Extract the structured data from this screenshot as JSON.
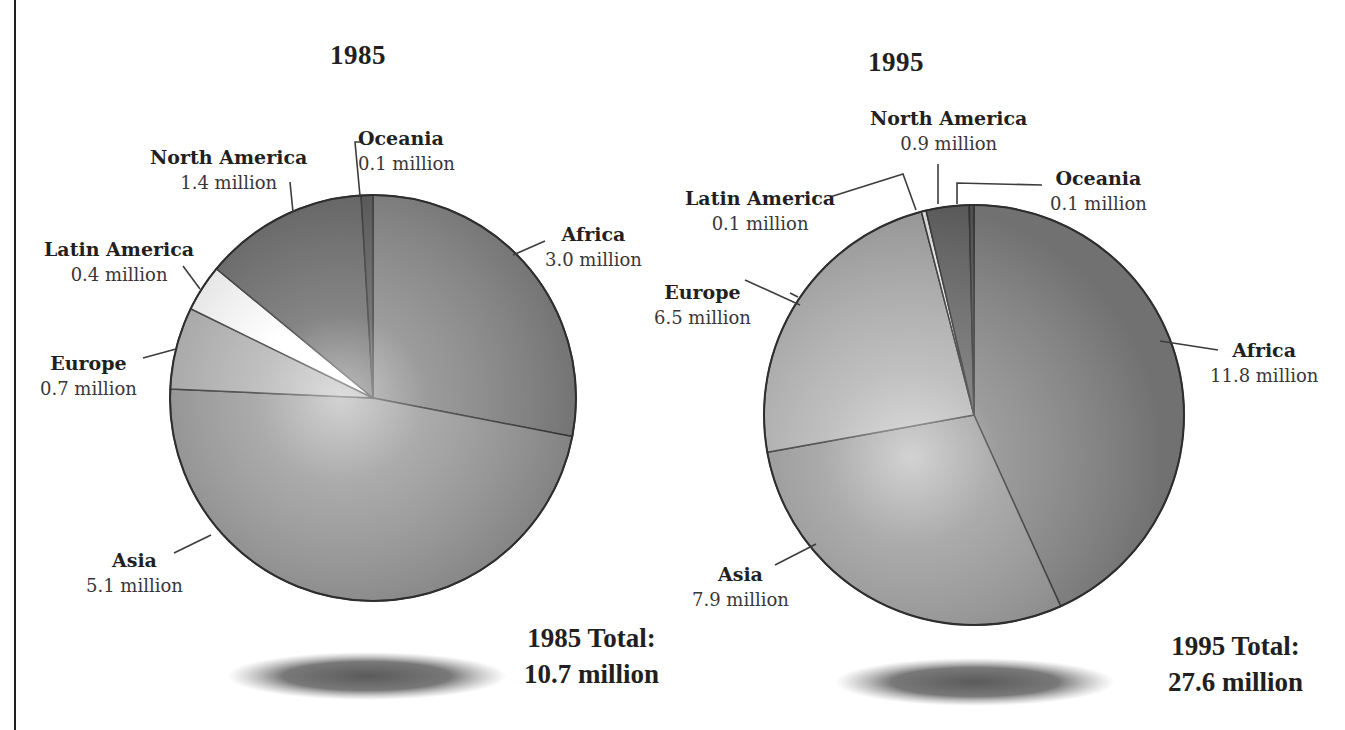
{
  "chart_data": [
    {
      "type": "pie",
      "title": "1985",
      "categories": [
        "Africa",
        "Asia",
        "Europe",
        "Latin America",
        "North America",
        "Oceania"
      ],
      "values": [
        3.0,
        5.1,
        0.7,
        0.4,
        1.4,
        0.1
      ],
      "unit": "million",
      "value_labels": [
        "3.0 million",
        "5.1 million",
        "0.7 million",
        "0.4 million",
        "1.4 million",
        "0.1 million"
      ],
      "total_label": "1985 Total:",
      "total_value": "10.7 million",
      "start_angle": "12 o'clock",
      "direction": "clockwise",
      "legend": "none (direct labels with leader lines)"
    },
    {
      "type": "pie",
      "title": "1995",
      "categories": [
        "Africa",
        "Asia",
        "Europe",
        "Latin America",
        "North America",
        "Oceania"
      ],
      "values": [
        11.8,
        7.9,
        6.5,
        0.1,
        0.9,
        0.1
      ],
      "unit": "million",
      "value_labels": [
        "11.8 million",
        "7.9 million",
        "6.5 million",
        "0.1 million",
        "0.9 million",
        "0.1 million"
      ],
      "total_label": "1995 Total:",
      "total_value": "27.6 million",
      "start_angle": "12 o'clock",
      "direction": "clockwise",
      "legend": "none (direct labels with leader lines)"
    }
  ],
  "colors": {
    "Africa": "#8a8a8a",
    "Asia": "#9c9c9c",
    "Europe": "#b4b4b4",
    "Latin America": "#ffffff",
    "North America": "#6e6e6e",
    "Oceania": "#5f5f5f",
    "outline": "#3c3c3c",
    "land": "#5a5a5a"
  },
  "pies": [
    {
      "year": "1985",
      "total_label": "1985 Total:",
      "total_value": "10.7 million",
      "labels": [
        {
          "name": "Oceania",
          "value": "0.1 million"
        },
        {
          "name": "North America",
          "value": "1.4 million"
        },
        {
          "name": "Africa",
          "value": "3.0 million"
        },
        {
          "name": "Latin America",
          "value": "0.4 million"
        },
        {
          "name": "Europe",
          "value": "0.7 million"
        },
        {
          "name": "Asia",
          "value": "5.1 million"
        }
      ]
    },
    {
      "year": "1995",
      "total_label": "1995 Total:",
      "total_value": "27.6 million",
      "labels": [
        {
          "name": "North America",
          "value": "0.9 million"
        },
        {
          "name": "Latin America",
          "value": "0.1 million"
        },
        {
          "name": "Oceania",
          "value": "0.1 million"
        },
        {
          "name": "Europe",
          "value": "6.5 million"
        },
        {
          "name": "Africa",
          "value": "11.8 million"
        },
        {
          "name": "Asia",
          "value": "7.9 million"
        }
      ]
    }
  ]
}
